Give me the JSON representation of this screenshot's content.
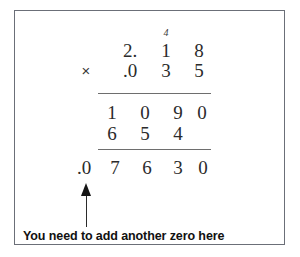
{
  "panel": {
    "border_color": "#6b6f78",
    "background_color": "#ffffff"
  },
  "problem": {
    "type": "long-multiplication",
    "operator": "×",
    "multiplicand": "2.18",
    "multiplier": ".035",
    "carry_digit": "4",
    "partial_products": [
      "1090",
      "654"
    ],
    "answer": ".07630",
    "multiplicand_digits": [
      "2.",
      "1",
      "8"
    ],
    "multiplier_digits": [
      ".0",
      "3",
      "5"
    ],
    "partial_1_digits": [
      "1",
      "0",
      "9",
      "0"
    ],
    "partial_2_digits": [
      "6",
      "5",
      "4"
    ],
    "answer_digits": [
      ".0",
      "7",
      "6",
      "3",
      "0"
    ]
  },
  "annotation": {
    "caption": "You need to add another zero here",
    "arrow": "up-arrow"
  }
}
